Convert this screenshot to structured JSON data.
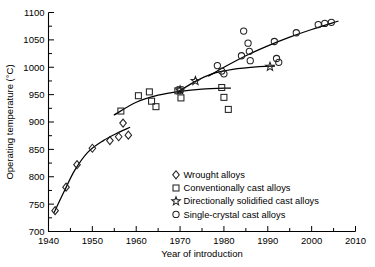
{
  "chart_data": {
    "type": "scatter",
    "title": "",
    "xlabel": "Year of introduction",
    "ylabel": "Operating temperature (°C)",
    "xlim": [
      1940,
      2010
    ],
    "ylim": [
      700,
      1100
    ],
    "xticks": [
      1940,
      1950,
      1960,
      1970,
      1980,
      1990,
      2000,
      2010
    ],
    "yticks": [
      700,
      750,
      800,
      850,
      900,
      950,
      1000,
      1050,
      1100
    ],
    "x_minor_step": 5,
    "y_minor_step": 25,
    "grid": false,
    "legend_position": "lower-center-right",
    "series": [
      {
        "name": "Wrought alloys",
        "marker": "diamond",
        "points": [
          {
            "x": 1941.5,
            "y": 738
          },
          {
            "x": 1944.0,
            "y": 781
          },
          {
            "x": 1946.5,
            "y": 822
          },
          {
            "x": 1950.0,
            "y": 852
          },
          {
            "x": 1954.0,
            "y": 866
          },
          {
            "x": 1956.0,
            "y": 873
          },
          {
            "x": 1957.0,
            "y": 898
          },
          {
            "x": 1958.2,
            "y": 876
          }
        ],
        "trend": [
          {
            "x": 1941.3,
            "y": 735
          },
          {
            "x": 1943.5,
            "y": 772
          },
          {
            "x": 1946.0,
            "y": 812
          },
          {
            "x": 1949.0,
            "y": 845
          },
          {
            "x": 1952.5,
            "y": 866
          },
          {
            "x": 1956.0,
            "y": 881
          },
          {
            "x": 1958.5,
            "y": 890
          }
        ]
      },
      {
        "name": "Conventionally cast alloys",
        "marker": "square",
        "points": [
          {
            "x": 1956.5,
            "y": 920
          },
          {
            "x": 1960.5,
            "y": 948
          },
          {
            "x": 1963.0,
            "y": 955
          },
          {
            "x": 1963.5,
            "y": 938
          },
          {
            "x": 1964.5,
            "y": 928
          },
          {
            "x": 1969.5,
            "y": 957
          },
          {
            "x": 1970.0,
            "y": 959
          },
          {
            "x": 1970.2,
            "y": 944
          },
          {
            "x": 1979.5,
            "y": 963
          },
          {
            "x": 1980.0,
            "y": 945
          },
          {
            "x": 1981.0,
            "y": 923
          }
        ],
        "trend": [
          {
            "x": 1955.0,
            "y": 913
          },
          {
            "x": 1960.0,
            "y": 936
          },
          {
            "x": 1965.0,
            "y": 949
          },
          {
            "x": 1970.0,
            "y": 956
          },
          {
            "x": 1975.0,
            "y": 960
          },
          {
            "x": 1981.5,
            "y": 962
          }
        ]
      },
      {
        "name": "Directionally solidified cast alloys",
        "marker": "star",
        "points": [
          {
            "x": 1970.0,
            "y": 958
          },
          {
            "x": 1973.5,
            "y": 975
          },
          {
            "x": 1990.5,
            "y": 1001
          }
        ],
        "trend": [
          {
            "x": 1969.5,
            "y": 955
          },
          {
            "x": 1973.0,
            "y": 972
          },
          {
            "x": 1977.0,
            "y": 987
          },
          {
            "x": 1982.0,
            "y": 996
          },
          {
            "x": 1988.0,
            "y": 1001
          },
          {
            "x": 1991.5,
            "y": 1002
          }
        ]
      },
      {
        "name": "Single-crystal cast alloys",
        "marker": "circle",
        "points": [
          {
            "x": 1978.5,
            "y": 1003
          },
          {
            "x": 1979.5,
            "y": 993
          },
          {
            "x": 1980.0,
            "y": 988
          },
          {
            "x": 1984.0,
            "y": 1021
          },
          {
            "x": 1984.5,
            "y": 1066
          },
          {
            "x": 1985.5,
            "y": 1044
          },
          {
            "x": 1985.8,
            "y": 1029
          },
          {
            "x": 1986.0,
            "y": 1012
          },
          {
            "x": 1991.5,
            "y": 1047
          },
          {
            "x": 1992.0,
            "y": 1016
          },
          {
            "x": 1992.5,
            "y": 1009
          },
          {
            "x": 1996.5,
            "y": 1063
          },
          {
            "x": 2001.5,
            "y": 1078
          },
          {
            "x": 2003.0,
            "y": 1080
          },
          {
            "x": 2004.5,
            "y": 1082
          }
        ],
        "trend": [
          {
            "x": 1976.5,
            "y": 984
          },
          {
            "x": 1980.0,
            "y": 1000
          },
          {
            "x": 1985.0,
            "y": 1021
          },
          {
            "x": 1990.0,
            "y": 1039
          },
          {
            "x": 1995.0,
            "y": 1055
          },
          {
            "x": 2000.0,
            "y": 1069
          },
          {
            "x": 2006.0,
            "y": 1084
          }
        ]
      }
    ],
    "legend": [
      {
        "marker": "diamond",
        "label": "Wrought alloys"
      },
      {
        "marker": "square",
        "label": "Conventionally cast alloys"
      },
      {
        "marker": "star",
        "label": "Directionally solidified cast alloys"
      },
      {
        "marker": "circle",
        "label": "Single-crystal cast alloys"
      }
    ]
  }
}
